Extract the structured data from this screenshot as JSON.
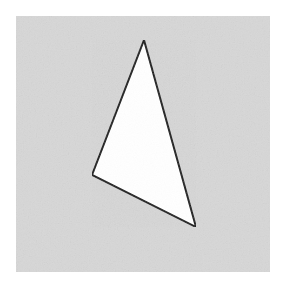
{
  "figure": {
    "title": "Triangle on gray background",
    "canvas": {
      "width": 287,
      "height": 295,
      "outer_background_color": "#ffffff"
    },
    "panel": {
      "name": "gray-paper-panel",
      "x": 16,
      "y": 16,
      "width": 254,
      "height": 256,
      "fill_color": "#d7d7d7",
      "texture": "subtle paper grain"
    },
    "shape": {
      "name": "triangle",
      "type": "triangle",
      "fill_color": "#ffffff",
      "stroke_color": "#1a1a1a",
      "stroke_width": 2,
      "vertices": [
        {
          "label": "apex",
          "x": 144,
          "y": 40
        },
        {
          "label": "left",
          "x": 92,
          "y": 175
        },
        {
          "label": "bottom-right",
          "x": 196,
          "y": 227
        }
      ],
      "points_string": "144,40 92,175 196,227",
      "edges": [
        {
          "label": "left-edge",
          "from": "apex",
          "to": "left"
        },
        {
          "label": "bottom-edge",
          "from": "left",
          "to": "bottom-right"
        },
        {
          "label": "right-edge",
          "from": "bottom-right",
          "to": "apex"
        }
      ]
    }
  }
}
